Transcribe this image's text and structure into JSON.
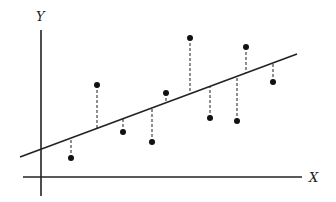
{
  "diagram": {
    "type": "linear-regression-residuals",
    "axes": {
      "x_label": "X",
      "y_label": "Y"
    },
    "colors": {
      "line": "#222222",
      "point": "#111111",
      "residual": "#333333",
      "background": "#ffffff"
    },
    "regression_line": {
      "x1": 20,
      "y1": 157,
      "x2": 297,
      "y2": 54
    },
    "points": [
      {
        "x": 71,
        "y": 158
      },
      {
        "x": 97,
        "y": 85
      },
      {
        "x": 123,
        "y": 132
      },
      {
        "x": 152,
        "y": 142
      },
      {
        "x": 166,
        "y": 93
      },
      {
        "x": 190,
        "y": 38
      },
      {
        "x": 210,
        "y": 118
      },
      {
        "x": 237,
        "y": 121
      },
      {
        "x": 246,
        "y": 47
      },
      {
        "x": 273,
        "y": 82
      }
    ]
  }
}
